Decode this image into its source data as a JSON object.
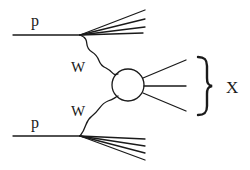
{
  "diagram": {
    "type": "feynman-diagram",
    "labels": {
      "proton_top": "p",
      "proton_bottom": "p",
      "boson_top": "W",
      "boson_bottom": "W",
      "final_state": "X"
    },
    "colors": {
      "line": "#1a1a1a",
      "background": "#ffffff"
    }
  }
}
